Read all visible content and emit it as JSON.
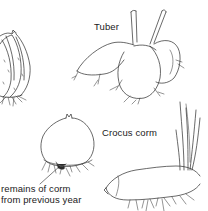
{
  "figure": {
    "labels": {
      "tuber": "Tuber",
      "crocus_corm": "Crocus corm",
      "remains_line1": "remains of corm",
      "remains_line2": "from previous year"
    },
    "illustrations": [
      {
        "name": "bulb",
        "description": "partial bulb with scales and roots, cropped at left edge"
      },
      {
        "name": "tuber",
        "description": "tuber with two shoots and roots"
      },
      {
        "name": "crocus-corm",
        "description": "round corm with old corm remains and roots"
      },
      {
        "name": "rhizome",
        "description": "elongated rhizome with leaf blades and roots"
      }
    ],
    "colors": {
      "ink": "#2a2a2a",
      "background": "#ffffff"
    }
  }
}
